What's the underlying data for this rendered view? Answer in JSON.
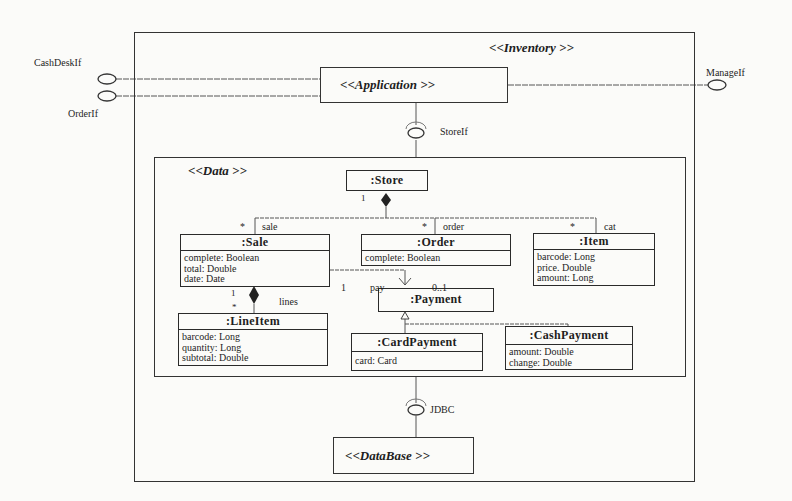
{
  "diagram": {
    "type": "UML component / class diagram",
    "outer_component": {
      "stereotype": "<<Inventory >>"
    },
    "application": {
      "stereotype": "<<Application    >>"
    },
    "data_component": {
      "stereotype": "<<Data >>"
    },
    "database": {
      "stereotype": "<<DataBase   >>"
    },
    "interfaces": {
      "cashdesk": "CashDeskIf",
      "order": "OrderIf",
      "manage": "ManageIf",
      "store": "StoreIf",
      "jdbc": "JDBC"
    },
    "classes": [
      {
        "id": "store",
        "name": ":Store",
        "attributes": []
      },
      {
        "id": "sale",
        "name": ":Sale",
        "attributes": [
          "complete: Boolean",
          "total: Double",
          "date: Date"
        ]
      },
      {
        "id": "order",
        "name": ":Order",
        "attributes": [
          "complete: Boolean"
        ]
      },
      {
        "id": "item",
        "name": ":Item",
        "attributes": [
          "barcode: Long",
          "price. Double",
          "amount: Long"
        ]
      },
      {
        "id": "payment",
        "name": ":Payment",
        "attributes": []
      },
      {
        "id": "lineitem",
        "name": ":LineItem",
        "attributes": [
          "barcode: Long",
          "quantity: Long",
          "subtotal: Double"
        ]
      },
      {
        "id": "cardpayment",
        "name": ":CardPayment",
        "attributes": [
          "card: Card"
        ]
      },
      {
        "id": "cashpayment",
        "name": ":CashPayment",
        "attributes": [
          "amount: Double",
          "change: Double"
        ]
      }
    ],
    "associations": {
      "store_mult": "1",
      "sale_mult": "*",
      "sale_role": "sale",
      "order_mult": "*",
      "order_role": "order",
      "item_mult": "*",
      "item_role": "cat",
      "sale_pay_mult": "1",
      "pay_role": "pay",
      "payment_mult": "0..1",
      "sale_lines_mult": "1",
      "lineitem_mult": "*",
      "lines_role": "lines"
    }
  }
}
